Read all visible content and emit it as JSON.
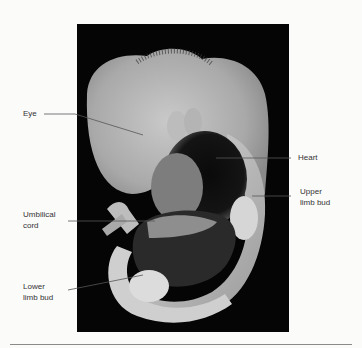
{
  "figure": {
    "labels": [
      {
        "id": "eye",
        "text": "Eye"
      },
      {
        "id": "heart",
        "text": "Heart"
      },
      {
        "id": "upper_limb_bud",
        "text": "Upper\nlimb bud"
      },
      {
        "id": "umbilical_cord",
        "text": "Umbilical\ncord"
      },
      {
        "id": "lower_limb_bud",
        "text": "Lower\nlimb bud"
      }
    ]
  },
  "colors": {
    "page_background": "#fbfbfa",
    "photo_background": "#050505",
    "label_text": "#333333",
    "leader_line": "#555555",
    "rule": "#8a8a8a"
  }
}
